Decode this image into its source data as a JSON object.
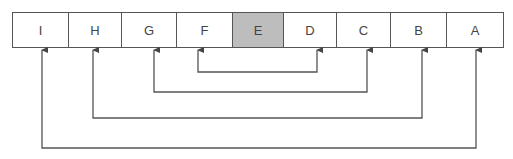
{
  "diagram": {
    "cells": [
      {
        "label": "I",
        "width": 56,
        "highlight": false
      },
      {
        "label": "H",
        "width": 53,
        "highlight": false
      },
      {
        "label": "G",
        "width": 55,
        "highlight": false
      },
      {
        "label": "F",
        "width": 56,
        "highlight": false
      },
      {
        "label": "E",
        "width": 51,
        "highlight": true
      },
      {
        "label": "D",
        "width": 53,
        "highlight": false
      },
      {
        "label": "C",
        "width": 54,
        "highlight": false
      },
      {
        "label": "B",
        "width": 56,
        "highlight": false
      },
      {
        "label": "A",
        "width": 56,
        "highlight": false
      }
    ],
    "links": [
      {
        "from": "F",
        "to": "D",
        "x1": 198,
        "x2": 317,
        "y": 72
      },
      {
        "from": "G",
        "to": "C",
        "x1": 154,
        "x2": 367,
        "y": 92
      },
      {
        "from": "H",
        "to": "B",
        "x1": 93,
        "x2": 422,
        "y": 118
      },
      {
        "from": "I",
        "to": "A",
        "x1": 42,
        "x2": 476,
        "y": 148
      }
    ],
    "colors": {
      "line": "#555555",
      "highlight": "#bdbdbd"
    }
  }
}
